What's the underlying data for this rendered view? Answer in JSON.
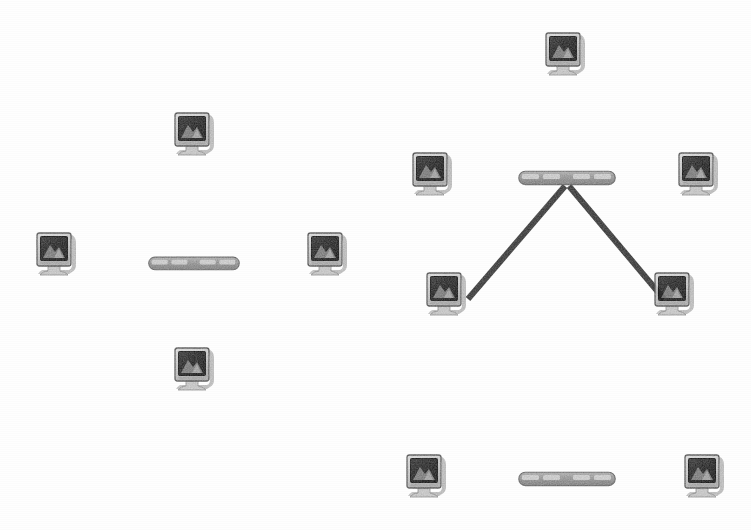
{
  "diagram": {
    "background_color": "#fefefe",
    "width": 751,
    "height": 530,
    "colors": {
      "link_dark": "#3a3a3a",
      "link_mid": "#6f6f6f",
      "hub_body": "#9a9a9a",
      "hub_port": "#d2d2d2",
      "hub_outline": "#6a6a6a",
      "monitor_bezel": "#cfcfcf",
      "monitor_screen_dark": "#2e2e2e",
      "monitor_screen_light": "#a9a9a9",
      "monitor_shadow": "#b9b9b9",
      "monitor_outline": "#4a4a4a",
      "base_color": "#c4c4c4"
    },
    "topologies": [
      {
        "id": "star",
        "name": "Star Topology",
        "hub_count": 1,
        "computer_count": 4,
        "description": "Four computers each connected by a single segment to one central hub."
      },
      {
        "id": "tree",
        "name": "Tree Topology",
        "hub_count": 2,
        "computer_count": 6,
        "description": "An upper hub links a computer above, computers to the left and right, two computers on diagonal branches, and a vertical trunk down to a second hub serving two more computers."
      }
    ],
    "hubs": [
      {
        "id": "star-hub",
        "label": "hub",
        "topology": "star",
        "x": 148,
        "y": 256,
        "w": 92,
        "h": 15,
        "ports": 4
      },
      {
        "id": "tree-hub-upper",
        "label": "hub",
        "topology": "tree",
        "x": 518,
        "y": 170,
        "w": 98,
        "h": 16,
        "ports": 4
      },
      {
        "id": "tree-hub-lower",
        "label": "hub",
        "topology": "tree",
        "x": 518,
        "y": 471,
        "w": 98,
        "h": 16,
        "ports": 4
      }
    ],
    "computers": [
      {
        "id": "star-pc-top",
        "label": "computer",
        "topology": "star",
        "x": 172,
        "y": 110,
        "w": 46,
        "h": 48
      },
      {
        "id": "star-pc-left",
        "label": "computer",
        "topology": "star",
        "x": 34,
        "y": 230,
        "w": 46,
        "h": 48
      },
      {
        "id": "star-pc-right",
        "label": "computer",
        "topology": "star",
        "x": 305,
        "y": 230,
        "w": 46,
        "h": 48
      },
      {
        "id": "star-pc-bottom",
        "label": "computer",
        "topology": "star",
        "x": 172,
        "y": 345,
        "w": 46,
        "h": 48
      },
      {
        "id": "tree-pc-top",
        "label": "computer",
        "topology": "tree",
        "x": 543,
        "y": 30,
        "w": 46,
        "h": 48
      },
      {
        "id": "tree-pc-left",
        "label": "computer",
        "topology": "tree",
        "x": 410,
        "y": 150,
        "w": 46,
        "h": 48
      },
      {
        "id": "tree-pc-right",
        "label": "computer",
        "topology": "tree",
        "x": 676,
        "y": 150,
        "w": 46,
        "h": 48
      },
      {
        "id": "tree-pc-diag-left",
        "label": "computer",
        "topology": "tree",
        "x": 424,
        "y": 270,
        "w": 46,
        "h": 48
      },
      {
        "id": "tree-pc-diag-right",
        "label": "computer",
        "topology": "tree",
        "x": 652,
        "y": 270,
        "w": 46,
        "h": 48
      },
      {
        "id": "tree-pc-bottom-left",
        "label": "computer",
        "topology": "tree",
        "x": 404,
        "y": 452,
        "w": 46,
        "h": 48
      },
      {
        "id": "tree-pc-bottom-right",
        "label": "computer",
        "topology": "tree",
        "x": 682,
        "y": 452,
        "w": 46,
        "h": 48
      }
    ],
    "links": [
      {
        "id": "link-star-top",
        "topology": "star",
        "from": "star-pc-top",
        "to": "star-hub",
        "x1": 195,
        "y1": 158,
        "x2": 195,
        "y2": 258,
        "thickness": 5
      },
      {
        "id": "link-star-bottom",
        "topology": "star",
        "from": "star-hub",
        "to": "star-pc-bottom",
        "x1": 195,
        "y1": 268,
        "x2": 195,
        "y2": 352,
        "thickness": 5
      },
      {
        "id": "link-star-left",
        "topology": "star",
        "from": "star-pc-left",
        "to": "star-hub",
        "x1": 80,
        "y1": 263,
        "x2": 150,
        "y2": 263,
        "thickness": 5
      },
      {
        "id": "link-star-right",
        "topology": "star",
        "from": "star-hub",
        "to": "star-pc-right",
        "x1": 238,
        "y1": 263,
        "x2": 308,
        "y2": 263,
        "thickness": 5
      },
      {
        "id": "link-tree-top",
        "topology": "tree",
        "from": "tree-pc-top",
        "to": "tree-hub-upper",
        "x1": 567,
        "y1": 78,
        "x2": 567,
        "y2": 172,
        "thickness": 5
      },
      {
        "id": "link-tree-left",
        "topology": "tree",
        "from": "tree-pc-left",
        "to": "tree-hub-upper",
        "x1": 455,
        "y1": 178,
        "x2": 520,
        "y2": 178,
        "thickness": 5
      },
      {
        "id": "link-tree-right",
        "topology": "tree",
        "from": "tree-hub-upper",
        "to": "tree-pc-right",
        "x1": 614,
        "y1": 178,
        "x2": 679,
        "y2": 178,
        "thickness": 5
      },
      {
        "id": "link-tree-diag-left",
        "topology": "tree",
        "from": "tree-hub-upper",
        "to": "tree-pc-diag-left",
        "x1": 566,
        "y1": 188,
        "x2": 470,
        "y2": 300,
        "thickness": 6
      },
      {
        "id": "link-tree-diag-right",
        "topology": "tree",
        "from": "tree-hub-upper",
        "to": "tree-pc-diag-right",
        "x1": 568,
        "y1": 188,
        "x2": 662,
        "y2": 300,
        "thickness": 6
      },
      {
        "id": "link-tree-trunk",
        "topology": "tree",
        "from": "tree-hub-upper",
        "to": "tree-hub-lower",
        "x1": 567,
        "y1": 186,
        "x2": 567,
        "y2": 473,
        "thickness": 6
      },
      {
        "id": "link-tree-bottom-left",
        "topology": "tree",
        "from": "tree-pc-bottom-left",
        "to": "tree-hub-lower",
        "x1": 450,
        "y1": 479,
        "x2": 520,
        "y2": 479,
        "thickness": 5
      },
      {
        "id": "link-tree-bottom-right",
        "topology": "tree",
        "from": "tree-hub-lower",
        "to": "tree-pc-bottom-right",
        "x1": 614,
        "y1": 479,
        "x2": 684,
        "y2": 479,
        "thickness": 5
      }
    ]
  }
}
